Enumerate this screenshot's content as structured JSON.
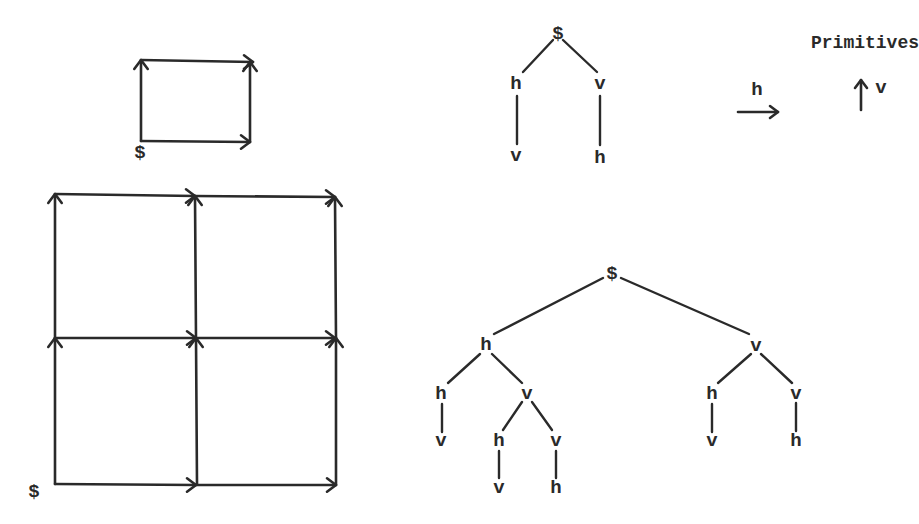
{
  "primitives": {
    "title": "Primitives",
    "h_label": "h",
    "v_label": "v",
    "h_arrow": {
      "x1": 738,
      "y1": 112,
      "x2": 778,
      "y2": 112
    },
    "v_arrow": {
      "x1": 861,
      "y1": 110,
      "x2": 861,
      "y2": 80
    }
  },
  "small_grid": {
    "start_label": "$",
    "start_pos": [
      140,
      153
    ],
    "edges": [
      {
        "x1": 141,
        "y1": 141,
        "x2": 141,
        "y2": 60,
        "dir": "up"
      },
      {
        "x1": 141,
        "y1": 60,
        "x2": 253,
        "y2": 62,
        "dir": "right"
      },
      {
        "x1": 141,
        "y1": 141,
        "x2": 250,
        "y2": 142,
        "dir": "right"
      },
      {
        "x1": 250,
        "y1": 142,
        "x2": 250,
        "y2": 62,
        "dir": "up"
      }
    ]
  },
  "big_grid": {
    "start_label": "$",
    "start_pos": [
      34,
      492
    ],
    "edges": [
      {
        "x1": 55,
        "y1": 484,
        "x2": 55,
        "y2": 338,
        "dir": "up"
      },
      {
        "x1": 55,
        "y1": 338,
        "x2": 55,
        "y2": 194,
        "dir": "up"
      },
      {
        "x1": 55,
        "y1": 484,
        "x2": 196,
        "y2": 485,
        "dir": "right"
      },
      {
        "x1": 196,
        "y1": 485,
        "x2": 336,
        "y2": 485,
        "dir": "right"
      },
      {
        "x1": 55,
        "y1": 338,
        "x2": 196,
        "y2": 338,
        "dir": "right"
      },
      {
        "x1": 196,
        "y1": 338,
        "x2": 335,
        "y2": 338,
        "dir": "right"
      },
      {
        "x1": 55,
        "y1": 194,
        "x2": 195,
        "y2": 196,
        "dir": "right"
      },
      {
        "x1": 195,
        "y1": 196,
        "x2": 335,
        "y2": 197,
        "dir": "right"
      },
      {
        "x1": 197,
        "y1": 484,
        "x2": 196,
        "y2": 338,
        "dir": "up"
      },
      {
        "x1": 196,
        "y1": 338,
        "x2": 195,
        "y2": 196,
        "dir": "up"
      },
      {
        "x1": 336,
        "y1": 485,
        "x2": 336,
        "y2": 338,
        "dir": "up"
      },
      {
        "x1": 336,
        "y1": 338,
        "x2": 335,
        "y2": 197,
        "dir": "up"
      }
    ]
  },
  "small_tree": {
    "nodes": [
      {
        "id": "root",
        "label": "$",
        "x": 558,
        "y": 34
      },
      {
        "id": "h1",
        "label": "h",
        "x": 516,
        "y": 84
      },
      {
        "id": "v1",
        "label": "v",
        "x": 600,
        "y": 84
      },
      {
        "id": "v2",
        "label": "v",
        "x": 516,
        "y": 156
      },
      {
        "id": "h2",
        "label": "h",
        "x": 600,
        "y": 158
      }
    ],
    "lines": [
      {
        "x1": 553,
        "y1": 40,
        "x2": 523,
        "y2": 72
      },
      {
        "x1": 563,
        "y1": 40,
        "x2": 597,
        "y2": 72
      },
      {
        "x1": 517,
        "y1": 96,
        "x2": 517,
        "y2": 144
      },
      {
        "x1": 600,
        "y1": 96,
        "x2": 600,
        "y2": 145
      }
    ]
  },
  "big_tree": {
    "nodes": [
      {
        "id": "root",
        "label": "$",
        "x": 612,
        "y": 274
      },
      {
        "id": "h",
        "label": "h",
        "x": 486,
        "y": 345
      },
      {
        "id": "v",
        "label": "v",
        "x": 756,
        "y": 346
      },
      {
        "id": "hh",
        "label": "h",
        "x": 441,
        "y": 394
      },
      {
        "id": "hv",
        "label": "v",
        "x": 527,
        "y": 394
      },
      {
        "id": "hhv",
        "label": "v",
        "x": 441,
        "y": 441
      },
      {
        "id": "hvh",
        "label": "h",
        "x": 499,
        "y": 441
      },
      {
        "id": "hvv",
        "label": "v",
        "x": 556,
        "y": 441
      },
      {
        "id": "hvhv",
        "label": "v",
        "x": 499,
        "y": 488
      },
      {
        "id": "hvvh",
        "label": "h",
        "x": 556,
        "y": 488
      },
      {
        "id": "vh",
        "label": "h",
        "x": 712,
        "y": 394
      },
      {
        "id": "vv",
        "label": "v",
        "x": 796,
        "y": 394
      },
      {
        "id": "vhv",
        "label": "v",
        "x": 712,
        "y": 441
      },
      {
        "id": "vvh",
        "label": "h",
        "x": 796,
        "y": 441
      }
    ],
    "lines": [
      {
        "x1": 603,
        "y1": 278,
        "x2": 494,
        "y2": 334
      },
      {
        "x1": 621,
        "y1": 278,
        "x2": 749,
        "y2": 334
      },
      {
        "x1": 480,
        "y1": 354,
        "x2": 448,
        "y2": 383
      },
      {
        "x1": 492,
        "y1": 354,
        "x2": 522,
        "y2": 383
      },
      {
        "x1": 442,
        "y1": 404,
        "x2": 442,
        "y2": 432
      },
      {
        "x1": 522,
        "y1": 402,
        "x2": 503,
        "y2": 430
      },
      {
        "x1": 532,
        "y1": 402,
        "x2": 552,
        "y2": 430
      },
      {
        "x1": 499,
        "y1": 451,
        "x2": 499,
        "y2": 478
      },
      {
        "x1": 556,
        "y1": 451,
        "x2": 556,
        "y2": 478
      },
      {
        "x1": 751,
        "y1": 354,
        "x2": 718,
        "y2": 383
      },
      {
        "x1": 761,
        "y1": 354,
        "x2": 792,
        "y2": 383
      },
      {
        "x1": 712,
        "y1": 404,
        "x2": 712,
        "y2": 432
      },
      {
        "x1": 796,
        "y1": 403,
        "x2": 796,
        "y2": 431
      }
    ]
  },
  "colors": {
    "ink": "#2a2a2a",
    "background": "#ffffff"
  }
}
